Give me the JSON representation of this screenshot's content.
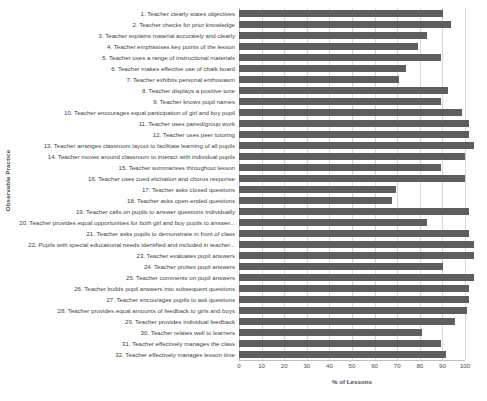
{
  "chart_data": {
    "type": "bar",
    "orientation": "horizontal",
    "title": "",
    "xlabel": "% of Lessons",
    "ylabel": "Observable Practice",
    "xlim": [
      0,
      100
    ],
    "xticks": [
      0,
      10,
      20,
      30,
      40,
      50,
      60,
      70,
      80,
      90,
      100
    ],
    "grid": true,
    "legend": "none",
    "bar_color": "#5e5e5e",
    "categories": [
      "1. Teacher clearly states objectives",
      "2. Teacher checks for prior knowledge",
      "3. Teacher explains material accurately and clearly",
      "4. Teacher emphasises key points of the lesson",
      "5. Teacher uses a range of instructional materials",
      "6. Teacher makes effective use of chalk board",
      "7. Teacher exhibits personal enthusiasm",
      "8. Teacher displays a positive tone",
      "9. Teacher knows pupil names",
      "10. Teacher encourages equal participation of girl and boy pupil",
      "11. Teacher uses paired/group work",
      "12. Teacher uses peer tutoring",
      "13. Teacher arranges classroom layout to facilitate learning of all pupils",
      "14. Teacher moves around classroom to interact with individual pupils",
      "15. Teacher summarises throughout lesson",
      "16. Teacher uses cued elicitation and chorus response",
      "17. Teacher asks closed questions",
      "18. Teacher asks open-ended questions",
      "19. Teacher calls on pupils to answer questions individually",
      "20. Teacher provides equal opportunities for both girl and boy pupils to answer...",
      "21. Teacher asks pupils to demonstrate in front of class",
      "22. Pupils with special educational needs identified and included in teacher...",
      "23. Teacher evaluates pupil answers",
      "24. Teacher probes pupil answers",
      "25. Teacher comments on pupil answers",
      "26. Teacher builds pupil answers into subsequent questions",
      "27. Teacher encourages pupils to ask questions",
      "28. Teacher provides equal amounts of feedback to girls and boys",
      "29. Teacher provides individual feedback",
      "30. Teacher relates well to learners",
      "31. Teacher effectively manages the class",
      "32.  Teacher effectively manages lesson time"
    ],
    "values": [
      87,
      90,
      80,
      76,
      86,
      71,
      68,
      89,
      86,
      95,
      98,
      98,
      100,
      96,
      86,
      96,
      67,
      65,
      98,
      80,
      98,
      100,
      100,
      87,
      100,
      98,
      98,
      97,
      92,
      78,
      86,
      88
    ]
  }
}
